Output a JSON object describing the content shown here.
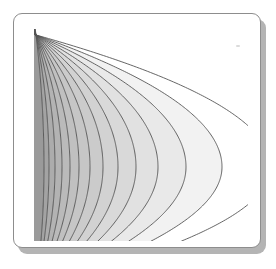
{
  "figure": {
    "kind": "scanned-contour-plot-figure",
    "title": "",
    "background_color": "#ffffff",
    "frame": {
      "name": "white-rounded-card",
      "fill": "#ffffff",
      "border_color": "#8d8d8d",
      "corner_radius": 9,
      "shadow_color": "#b4b4b4",
      "shadow_offset": 5
    },
    "artifacts": {
      "speck_color": "#cfcfcf"
    }
  },
  "chart_data": {
    "type": "line",
    "subtype": "contour",
    "title": "",
    "subtitle": "",
    "xlabel": "",
    "ylabel": "",
    "xlim": [
      0,
      214
    ],
    "ylim": [
      0,
      212
    ],
    "grid": false,
    "legend": null,
    "axes_visible": false,
    "tick_labels_x": [],
    "tick_labels_y": [],
    "annotations": [],
    "contour_line_color": "#555555",
    "contour_line_width": 0.9,
    "vertex_focus": {
      "x": 2,
      "y": 138
    },
    "fill_outside": "#ffffff",
    "levels": [
      {
        "index": 1,
        "label": "L1",
        "half_width": 8,
        "vertex_x": 2,
        "fill": "#9a9a9a"
      },
      {
        "index": 2,
        "label": "L2",
        "half_width": 13,
        "vertex_x": 2,
        "fill": "#a3a3a3"
      },
      {
        "index": 3,
        "label": "L3",
        "half_width": 19,
        "vertex_x": 2,
        "fill": "#acacac"
      },
      {
        "index": 4,
        "label": "L4",
        "half_width": 26,
        "vertex_x": 2,
        "fill": "#b3b3b3"
      },
      {
        "index": 5,
        "label": "L5",
        "half_width": 34,
        "vertex_x": 2,
        "fill": "#bababa"
      },
      {
        "index": 6,
        "label": "L6",
        "half_width": 43,
        "vertex_x": 2,
        "fill": "#c0c0c0"
      },
      {
        "index": 7,
        "label": "L7",
        "half_width": 54,
        "vertex_x": 2,
        "fill": "#c6c6c6"
      },
      {
        "index": 8,
        "label": "L8",
        "half_width": 67,
        "vertex_x": 2,
        "fill": "#cbcbcb"
      },
      {
        "index": 9,
        "label": "L9",
        "half_width": 82,
        "vertex_x": 2,
        "fill": "#d2d2d2"
      },
      {
        "index": 10,
        "label": "L10",
        "half_width": 100,
        "vertex_x": 2,
        "fill": "#d9d9d9"
      },
      {
        "index": 11,
        "label": "L11",
        "half_width": 122,
        "vertex_x": 2,
        "fill": "#e1e1e1"
      },
      {
        "index": 12,
        "label": "L12",
        "half_width": 150,
        "vertex_x": 2,
        "fill": "#e9e9e9"
      },
      {
        "index": 13,
        "label": "L13",
        "half_width": 186,
        "vertex_x": 2,
        "fill": "#f2f2f2"
      },
      {
        "index": 14,
        "label": "L14",
        "half_width": 235,
        "vertex_x": 2,
        "fill": "#ffffff"
      }
    ]
  }
}
